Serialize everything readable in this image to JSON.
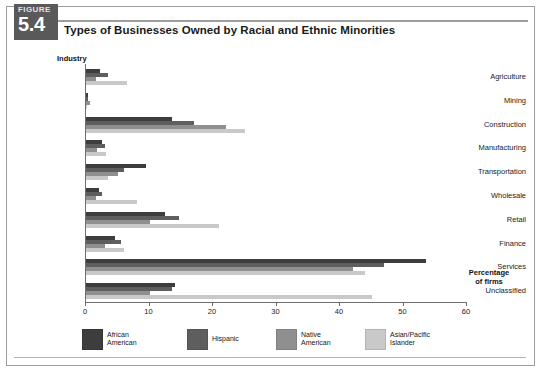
{
  "figure": {
    "label_word": "FIGURE",
    "number": "5.4",
    "title": "Types of Businesses Owned by Racial and Ethnic Minorities"
  },
  "axis_caption": "Percentage\nof firms",
  "colors": {
    "african_american": "#3d3d3d",
    "hispanic": "#5e5e5e",
    "native_american": "#8f8f8f",
    "asian_pacific_islander": "#c9c9c9",
    "badge": "#595959",
    "axis": "#6e6e6e",
    "frame": "#9d9d9d"
  },
  "legend": {
    "items": [
      {
        "label": "African\nAmerican",
        "color_key": "african_american"
      },
      {
        "label": "Hispanic",
        "color_key": "hispanic"
      },
      {
        "label": "Native\nAmerican",
        "color_key": "native_american"
      },
      {
        "label": "Asian/Pacific\nIslander",
        "color_key": "asian_pacific_islander"
      }
    ]
  },
  "chart_data": {
    "type": "bar",
    "orientation": "horizontal",
    "title": "Types of Businesses Owned by Racial and Ethnic Minorities",
    "xlabel": "Percentage of firms",
    "ylabel": "Industry",
    "xlim": [
      0,
      60
    ],
    "xticks": [
      0,
      10,
      20,
      30,
      40,
      50,
      60
    ],
    "grid": false,
    "legend_position": "bottom",
    "categories": [
      "Agriculture",
      "Mining",
      "Construction",
      "Manufacturing",
      "Transportation",
      "Wholesale",
      "Retail",
      "Finance",
      "Services",
      "Unclassified"
    ],
    "series": [
      {
        "name": "African American",
        "color": "#3d3d3d",
        "values": [
          2.2,
          0.3,
          13.5,
          2.5,
          9.5,
          2.0,
          12.4,
          4.5,
          53.5,
          14.0
        ]
      },
      {
        "name": "Hispanic",
        "color": "#5e5e5e",
        "values": [
          3.5,
          0.3,
          17.0,
          3.0,
          6.0,
          2.5,
          14.6,
          5.5,
          47.0,
          13.5
        ]
      },
      {
        "name": "Native American",
        "color": "#8f8f8f",
        "values": [
          1.5,
          0.6,
          22.0,
          1.8,
          5.0,
          1.5,
          10.0,
          3.0,
          42.0,
          10.0
        ]
      },
      {
        "name": "Asian/Pacific Islander",
        "color": "#c9c9c9",
        "values": [
          6.5,
          0.2,
          25.0,
          3.2,
          3.5,
          8.0,
          21.0,
          6.0,
          44.0,
          45.0
        ]
      }
    ]
  }
}
